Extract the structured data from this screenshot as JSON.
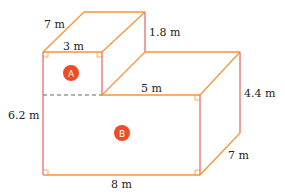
{
  "diagram": {
    "colors": {
      "edge_left": "#f06a6a",
      "edge_orange": "#f7943a",
      "badge": "#ee4c24",
      "dashed": "#666666"
    },
    "labels": {
      "depth_top": "7 m",
      "width_a": "3 m",
      "height_a": "1.8 m",
      "step_width": "5 m",
      "height_b_right": "4.4 m",
      "total_height": "6.2 m",
      "width_b": "8 m",
      "depth_bottom": "7 m"
    },
    "parts": {
      "a": "A",
      "b": "B"
    }
  }
}
